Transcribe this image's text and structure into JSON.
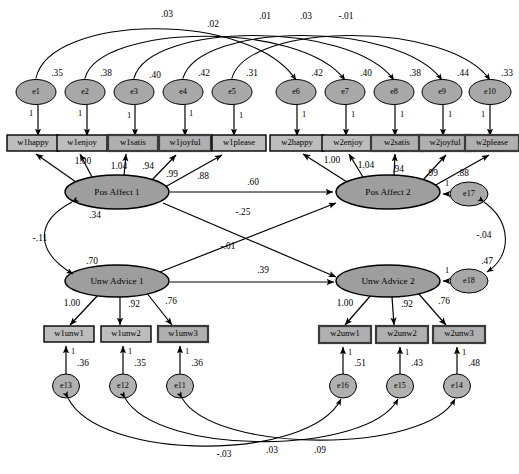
{
  "figure": {
    "type": "sem-path-diagram",
    "title": "",
    "caption": "",
    "width": 519,
    "height": 474,
    "colors": {
      "node_fill": "#a8a8a8",
      "box_fill": "#bdbdbd",
      "stroke": "#000000",
      "background": "#ffffff"
    }
  },
  "latent_variables": [
    {
      "id": "PA1",
      "label": "Pos Affect 1",
      "variance": ".34",
      "cx": 117,
      "cy": 192,
      "rx": 52,
      "ry": 17
    },
    {
      "id": "PA2",
      "label": "Pos Affect 2",
      "variance": "",
      "cx": 388,
      "cy": 192,
      "rx": 52,
      "ry": 17
    },
    {
      "id": "UA1",
      "label": "Unw Advice 1",
      "variance": ".70",
      "cx": 117,
      "cy": 281,
      "rx": 52,
      "ry": 16
    },
    {
      "id": "UA2",
      "label": "Unw Advice 2",
      "variance": "",
      "cx": 388,
      "cy": 281,
      "rx": 52,
      "ry": 16
    }
  ],
  "disturbances": [
    {
      "id": "e17",
      "label": "e17",
      "variance": "",
      "target": "PA2",
      "cx": 469,
      "cy": 194,
      "rx": 19,
      "ry": 12,
      "loading": "1"
    },
    {
      "id": "e18",
      "label": "e18",
      "variance": ".47",
      "target": "UA2",
      "cx": 469,
      "cy": 281,
      "rx": 19,
      "ry": 12,
      "loading": "1"
    }
  ],
  "indicators_wave1_pa": [
    {
      "box": "w1happy",
      "err": "e1",
      "err_var": ".35",
      "loading": "1.00",
      "bx": 30,
      "by": 139,
      "ex": 38,
      "ey": 99
    },
    {
      "box": "w1enjoy",
      "err": "e2",
      "err_var": ".38",
      "loading": "1.04",
      "bx": 79,
      "by": 139,
      "ex": 87,
      "ey": 99
    },
    {
      "box": "w1satis",
      "err": "e3",
      "err_var": ".40",
      "loading": ".94",
      "bx": 128,
      "by": 139,
      "ex": 135,
      "ey": 99
    },
    {
      "box": "w1joyful",
      "err": "e4",
      "err_var": ".42",
      "loading": ".99",
      "bx": 177,
      "by": 139,
      "ex": 184,
      "ey": 99
    },
    {
      "box": "w1please",
      "err": "e5",
      "err_var": ".31",
      "loading": ".88",
      "bx": 227,
      "by": 139,
      "ex": 234,
      "ey": 99
    }
  ],
  "indicators_wave2_pa": [
    {
      "box": "w2happy",
      "err": "e6",
      "err_var": ".42",
      "loading": "1.00",
      "bx": 287,
      "by": 139,
      "ex": 293,
      "ey": 99
    },
    {
      "box": "w2enjoy",
      "err": "e7",
      "err_var": ".40",
      "loading": "1.04",
      "bx": 336,
      "by": 139,
      "ex": 342,
      "ey": 99
    },
    {
      "box": "w2satis",
      "err": "e8",
      "err_var": ".38",
      "loading": ".94",
      "bx": 385,
      "by": 139,
      "ex": 391,
      "ey": 99
    },
    {
      "box": "w2joyful",
      "err": "e9",
      "err_var": ".44",
      "loading": ".99",
      "bx": 434,
      "by": 139,
      "ex": 440,
      "ey": 99
    },
    {
      "box": "w2please",
      "err": "e10",
      "err_var": ".33",
      "loading": ".88",
      "bx": 483,
      "by": 139,
      "ex": 488,
      "ey": 99
    }
  ],
  "indicators_wave1_ua": [
    {
      "box": "w1unw1",
      "err": "e13",
      "err_var": ".36",
      "loading": "1.00",
      "bx": 60,
      "by": 330,
      "ex": 60,
      "ey": 374
    },
    {
      "box": "w1unw2",
      "err": "e12",
      "err_var": ".35",
      "loading": ".92",
      "bx": 118,
      "by": 330,
      "ex": 118,
      "ey": 374
    },
    {
      "box": "w1unw3",
      "err": "e11",
      "err_var": ".36",
      "loading": ".76",
      "bx": 176,
      "by": 330,
      "ex": 176,
      "ey": 374
    }
  ],
  "indicators_wave2_ua": [
    {
      "box": "w2unw1",
      "err": "e16",
      "err_var": ".51",
      "loading": "1.00",
      "bx": 337,
      "by": 330,
      "ex": 337,
      "ey": 374
    },
    {
      "box": "w2unw2",
      "err": "e15",
      "err_var": ".43",
      "loading": ".92",
      "bx": 395,
      "by": 330,
      "ex": 395,
      "ey": 374
    },
    {
      "box": "w2unw3",
      "err": "e14",
      "err_var": ".48",
      "loading": ".76",
      "bx": 453,
      "by": 330,
      "ex": 453,
      "ey": 374
    }
  ],
  "structural_paths": [
    {
      "id": "pa1_pa2",
      "from": "PA1",
      "to": "PA2",
      "estimate": ".60",
      "lx": 253,
      "ly": 184
    },
    {
      "id": "pa1_ua2",
      "from": "PA1",
      "to": "UA2",
      "estimate": "-.25",
      "lx": 243,
      "ly": 214
    },
    {
      "id": "ua1_pa2",
      "from": "UA1",
      "to": "PA2",
      "estimate": "-.01",
      "lx": 228,
      "ly": 247
    },
    {
      "id": "ua1_ua2",
      "from": "UA1",
      "to": "UA2",
      "estimate": ".39",
      "lx": 263,
      "ly": 272
    }
  ],
  "latent_covariance": {
    "id": "pa1_ua1",
    "from": "PA1",
    "to": "UA1",
    "estimate": "-.11",
    "lx": 39,
    "ly": 239
  },
  "disturbance_covariance": {
    "id": "e17_e18",
    "from": "e17",
    "to": "e18",
    "estimate": "-.04",
    "lx": 484,
    "ly": 235
  },
  "error_correlations_top": [
    {
      "id": "e1_e6",
      "from": "e1",
      "to": "e6",
      "estimate": ".03",
      "lx": 167,
      "ly": 15
    },
    {
      "id": "e2_e7",
      "from": "e2",
      "to": "e7",
      "estimate": ".02",
      "lx": 213,
      "ly": 23
    },
    {
      "id": "e3_e8",
      "from": "e3",
      "to": "e8",
      "estimate": ".01",
      "lx": 265,
      "ly": 16
    },
    {
      "id": "e4_e9",
      "from": "e4",
      "to": "e9",
      "estimate": ".03",
      "lx": 306,
      "ly": 16
    },
    {
      "id": "e5_e10",
      "from": "e5",
      "to": "e10",
      "estimate": "-.01",
      "lx": 345,
      "ly": 16
    }
  ],
  "error_correlations_bottom": [
    {
      "id": "e13_e16",
      "from": "e13",
      "to": "e16",
      "estimate": "-.03",
      "lx": 224,
      "ly": 455
    },
    {
      "id": "e12_e15",
      "from": "e12",
      "to": "e15",
      "estimate": ".03",
      "lx": 272,
      "ly": 452
    },
    {
      "id": "e11_e14",
      "from": "e11",
      "to": "e14",
      "estimate": ".09",
      "lx": 320,
      "ly": 452
    }
  ],
  "fixed_loading_marker": "1"
}
